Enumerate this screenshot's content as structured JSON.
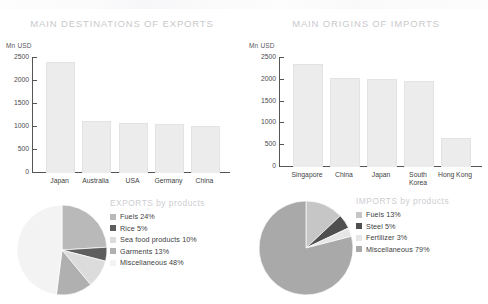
{
  "chart_data": [
    {
      "type": "bar",
      "title": "MAIN DESTINATIONS OF EXPORTS",
      "ylabel": "Mn USD",
      "xlabel": "",
      "categories": [
        "Japan",
        "Australia",
        "USA",
        "Germany",
        "China"
      ],
      "values": [
        2390,
        1110,
        1070,
        1040,
        1000
      ],
      "yticks": [
        0,
        500,
        1000,
        1500,
        2000,
        2500
      ],
      "ylim": [
        0,
        2500
      ],
      "grid": false,
      "legend": "none",
      "bar_color": "#ececec"
    },
    {
      "type": "bar",
      "title": "MAIN ORIGINS OF IMPORTS",
      "ylabel": "Mn USD",
      "xlabel": "",
      "categories": [
        "Singapore",
        "China",
        "Japan",
        "South\nKorea",
        "Hong Kong"
      ],
      "values": [
        2340,
        2010,
        2000,
        1950,
        650
      ],
      "yticks": [
        0,
        500,
        1000,
        1500,
        2000,
        2500
      ],
      "ylim": [
        0,
        2500
      ],
      "grid": false,
      "legend": "none",
      "bar_color": "#ececec"
    },
    {
      "type": "pie",
      "title": "EXPORTS by products",
      "labels": [
        "Fuels",
        "Rice",
        "Sea food products",
        "Garments",
        "Miscellaneous"
      ],
      "values": [
        24,
        5,
        10,
        13,
        48
      ],
      "value_labels": [
        "Fuels 24%",
        "Rice 5%",
        "Sea food products 10%",
        "Garments 13%",
        "Miscellaneous 48%"
      ],
      "colors": [
        "#b9b9b9",
        "#5e5e5e",
        "#dcdcdc",
        "#b0b0b0",
        "#f0f0f0"
      ],
      "legend": "right",
      "start_angle_deg": 0
    },
    {
      "type": "pie",
      "title": "IMPORTS by products",
      "labels": [
        "Fuels",
        "Steel",
        "Fertilizer",
        "Miscellaneous"
      ],
      "values": [
        13,
        5,
        3,
        79
      ],
      "value_labels": [
        "Fuels 13%",
        "Steel 5%",
        "Fertilizer 3%",
        "Miscellaneous 79%"
      ],
      "colors": [
        "#c6c6c6",
        "#4f4f4f",
        "#e6e6e6",
        "#a9a9a9"
      ],
      "legend": "right",
      "start_angle_deg": 0
    }
  ],
  "exports_bar": {
    "title": "MAIN DESTINATIONS OF EXPORTS",
    "unit": "Mn USD",
    "ticks": [
      "2500",
      "2000",
      "1500",
      "1000",
      "500",
      "0"
    ],
    "categories": [
      "Japan",
      "Australia",
      "USA",
      "Germany",
      "China"
    ]
  },
  "imports_bar": {
    "title": "MAIN ORIGINS OF IMPORTS",
    "unit": "Mn USD",
    "ticks": [
      "2500",
      "2000",
      "1500",
      "1000",
      "500",
      "0"
    ],
    "categories": [
      "Singapore",
      "China",
      "Japan",
      "South\nKorea",
      "Hong Kong"
    ]
  },
  "exports_pie": {
    "title": "EXPORTS by products",
    "items": [
      {
        "label": "Fuels 24%",
        "color": "#b9b9b9"
      },
      {
        "label": "Rice 5%",
        "color": "#5e5e5e"
      },
      {
        "label": "Sea food products 10%",
        "color": "#dcdcdc"
      },
      {
        "label": "Garments 13%",
        "color": "#b0b0b0"
      },
      {
        "label": "Miscellaneous 48%",
        "color": "#f3f3f3"
      }
    ]
  },
  "imports_pie": {
    "title": "IMPORTS by products",
    "items": [
      {
        "label": "Fuels 13%",
        "color": "#c6c6c6"
      },
      {
        "label": "Steel 5%",
        "color": "#4f4f4f"
      },
      {
        "label": "Fertilizer 3%",
        "color": "#e6e6e6"
      },
      {
        "label": "Miscellaneous 79%",
        "color": "#a9a9a9"
      }
    ]
  }
}
